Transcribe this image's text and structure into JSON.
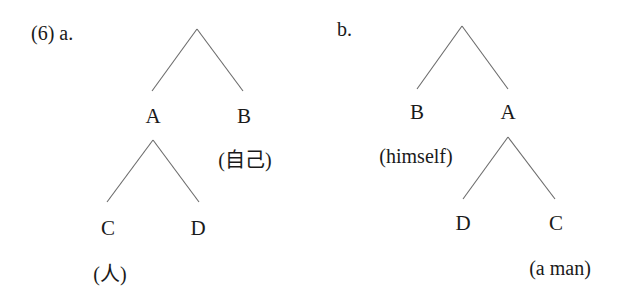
{
  "example_number": "(6)",
  "trees": [
    {
      "label": "a.",
      "root": "",
      "children_level1": [
        "A",
        "B"
      ],
      "children_of_A": [
        "C",
        "D"
      ],
      "glosses": {
        "B": "(自己)",
        "C": "(人)"
      }
    },
    {
      "label": "b.",
      "root": "",
      "children_level1": [
        "B",
        "A"
      ],
      "children_of_A": [
        "D",
        "C"
      ],
      "glosses": {
        "B": "(himself)",
        "C": "(a man)"
      }
    }
  ],
  "colors": {
    "line": "#6b6b6b",
    "text": "#1a1a1a",
    "background": "#ffffff"
  }
}
